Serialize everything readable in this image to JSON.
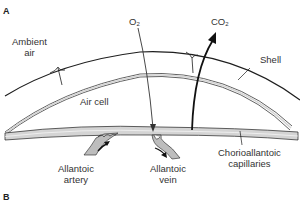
{
  "panels": {
    "top": "A",
    "bottom": "B"
  },
  "labels": {
    "ambient_air_line1": "Ambient",
    "ambient_air_line2": "air",
    "o2": "O",
    "o2_sub": "2",
    "co2": "CO",
    "co2_sub": "2",
    "shell": "Shell",
    "air_cell": "Air cell",
    "allantoic_artery_line1": "Allantoic",
    "allantoic_artery_line2": "artery",
    "allantoic_vein_line1": "Allantoic",
    "allantoic_vein_line2": "vein",
    "chorioallantoic_line1": "Chorioallantoic",
    "chorioallantoic_line2": "capillaries"
  },
  "colors": {
    "line": "#1e1e1e",
    "membrane_fill": "#d4d4d4",
    "vessel_fill": "#bdbdbd"
  }
}
